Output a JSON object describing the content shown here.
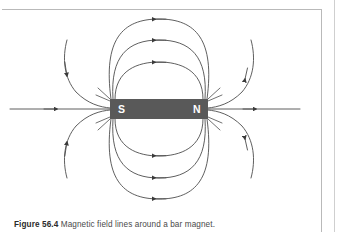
{
  "figure": {
    "caption_label": "Figure 56.4",
    "caption_text": "Magnetic field lines around a bar magnet.",
    "caption_full": "Figure 56.4 Magnetic field lines around a bar magnet."
  },
  "magnet": {
    "south_pole_label": "S",
    "north_pole_label": "N",
    "body_color": "#595959",
    "label_color": "#ffffff",
    "x": 110,
    "y": 99,
    "width": 98,
    "height": 20
  },
  "diagram": {
    "line_color": "#4d4d4d",
    "background_color": "#ffffff",
    "frame_color": "#b9b9b9",
    "field_line_direction": "N-to-S outside the magnet (arrows point left along the upper and lower loops, and right along the horizontal axis)",
    "axis_line": {
      "left_end_x": 10,
      "right_end_x": 300,
      "y": 109,
      "arrow_direction": "right",
      "arrow_count": 2
    },
    "loops": [
      {
        "name": "inner-loop-top",
        "half_width": 44,
        "half_height": 36,
        "arrow_direction": "left"
      },
      {
        "name": "middle-loop-top",
        "half_width": 66,
        "half_height": 58,
        "arrow_direction": "left"
      },
      {
        "name": "outer-loop-top",
        "half_width": 86,
        "half_height": 80,
        "arrow_direction": "left"
      },
      {
        "name": "inner-loop-bottom",
        "half_width": 44,
        "half_height": 36,
        "arrow_direction": "left"
      },
      {
        "name": "middle-loop-bottom",
        "half_width": 66,
        "half_height": 58,
        "arrow_direction": "left"
      },
      {
        "name": "outer-loop-bottom",
        "half_width": 86,
        "half_height": 80,
        "arrow_direction": "left"
      }
    ],
    "open_lines": [
      {
        "name": "open-line-upper-left",
        "arrow_direction": "down-left"
      },
      {
        "name": "open-line-upper-right",
        "arrow_direction": "up-right"
      },
      {
        "name": "open-line-lower-left",
        "arrow_direction": "up-left"
      },
      {
        "name": "open-line-lower-right",
        "arrow_direction": "down-right"
      }
    ]
  }
}
